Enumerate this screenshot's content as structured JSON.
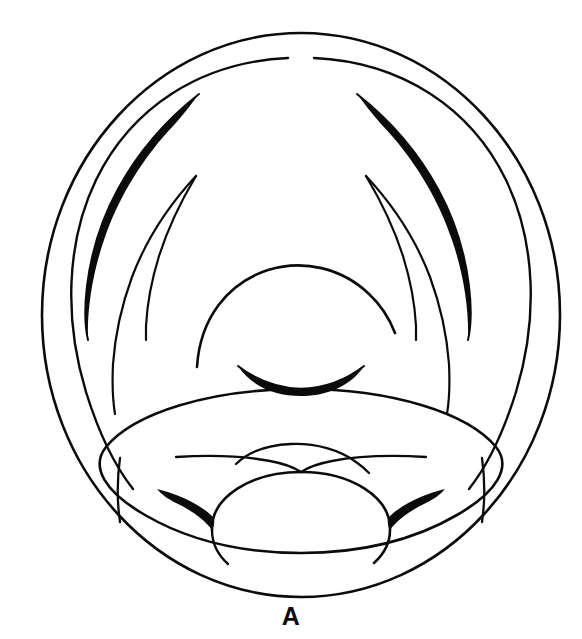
{
  "figure": {
    "label": "A",
    "caption_position": "bottom-center",
    "kind": "anatomical-line-drawing",
    "background_color": "#ffffff",
    "ink_color": "#0b0b0b",
    "canvas": {
      "width": 582,
      "height": 639
    },
    "stroke": {
      "thin": 2.0,
      "medium": 2.6,
      "thick": 3.0
    },
    "outline": {
      "name": "outer-rim-circle",
      "cx": 301,
      "cy": 315,
      "rx": 259,
      "ry": 282,
      "top_y": 33,
      "bottom_y": 597,
      "left_x": 42,
      "right_x": 560
    },
    "inner_rim": {
      "name": "inner-rim-arc",
      "description": "second concentric arc inset from the outer rim, open at the bottom"
    },
    "structures": [
      {
        "name": "outer-rim-circle",
        "type": "closed-ellipse"
      },
      {
        "name": "inner-rim-arc-left",
        "type": "open-arc"
      },
      {
        "name": "inner-rim-arc-right",
        "type": "open-arc"
      },
      {
        "name": "aryepiglottic-fold-left",
        "type": "tapered-sliver",
        "filled": true
      },
      {
        "name": "aryepiglottic-fold-right",
        "type": "tapered-sliver",
        "filled": true
      },
      {
        "name": "ventricular-fold-left",
        "type": "tapered-spike"
      },
      {
        "name": "ventricular-fold-right",
        "type": "tapered-spike"
      },
      {
        "name": "vocal-fold-left",
        "type": "tapered-spike"
      },
      {
        "name": "vocal-fold-right",
        "type": "tapered-spike"
      },
      {
        "name": "epiglottis-arc",
        "type": "open-arc"
      },
      {
        "name": "anterior-commissure-crescent",
        "type": "filled-crescent",
        "filled": true
      },
      {
        "name": "tongue-base-ellipse",
        "type": "large-ellipse"
      },
      {
        "name": "vallecula-ridge-left",
        "type": "open-arc"
      },
      {
        "name": "vallecula-ridge-right",
        "type": "open-arc"
      },
      {
        "name": "median-glossoepiglottic-dome",
        "type": "open-arc"
      },
      {
        "name": "pyriform-wedge-left",
        "type": "filled-wedge",
        "filled": true
      },
      {
        "name": "pyriform-wedge-right",
        "type": "filled-wedge",
        "filled": true
      },
      {
        "name": "lateral-strut-left",
        "type": "short-arc"
      },
      {
        "name": "lateral-strut-right",
        "type": "short-arc"
      }
    ]
  }
}
